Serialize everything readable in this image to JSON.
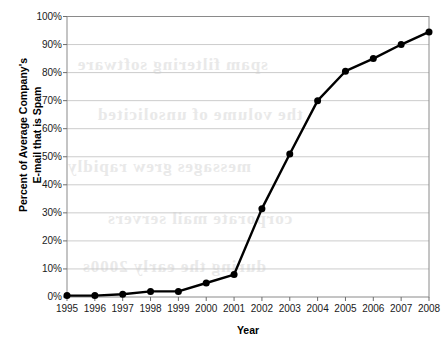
{
  "chart_data": {
    "type": "line",
    "title": "",
    "xlabel": "Year",
    "ylabel": "Percent of Average Company's E-mail that is Spam",
    "ylabel_line1": "Percent of Average Company's",
    "ylabel_line2": "E-mail that is Spam",
    "categories": [
      "1995",
      "1996",
      "1997",
      "1998",
      "1999",
      "2000",
      "2001",
      "2002",
      "2003",
      "2004",
      "2005",
      "2006",
      "2007",
      "2008"
    ],
    "values": [
      0.5,
      0.5,
      1,
      2,
      2,
      5,
      8,
      31.5,
      51,
      70,
      80.5,
      85,
      90,
      94.5
    ],
    "x": [
      1995,
      1996,
      1997,
      1998,
      1999,
      2000,
      2001,
      2002,
      2003,
      2004,
      2005,
      2006,
      2007,
      2008
    ],
    "series": [
      {
        "name": "Percent of Average Company's E-mail that is Spam",
        "values": [
          0.5,
          0.5,
          1,
          2,
          2,
          5,
          8,
          31.5,
          51,
          70,
          80.5,
          85,
          90,
          94.5
        ]
      }
    ],
    "ylim": [
      0,
      100
    ],
    "xlim": [
      1995,
      2008
    ],
    "y_ticks": [
      0,
      10,
      20,
      30,
      40,
      50,
      60,
      70,
      80,
      90,
      100
    ],
    "y_tick_labels": [
      "0%",
      "10%",
      "20%",
      "30%",
      "40%",
      "50%",
      "60%",
      "70%",
      "80%",
      "90%",
      "100%"
    ],
    "x_tick_labels": [
      "1995",
      "1996",
      "1997",
      "1998",
      "1999",
      "2000",
      "2001",
      "2002",
      "2003",
      "2004",
      "2005",
      "2006",
      "2007",
      "2008"
    ],
    "grid": true,
    "grid_axis": "y",
    "legend": false,
    "legend_position": "none",
    "marker": "circle",
    "line_color": "#000000",
    "marker_color": "#000000",
    "grid_color": "#cccccc",
    "background_color": "#ffffff",
    "annotations": []
  },
  "artifacts": {
    "description": "faint reversed text bleed-through from scanned page",
    "blots": [
      "spam filtering software",
      "the volume of unsolicited",
      "messages grew rapidly",
      "corporate mail servers",
      "during the early 2000s"
    ]
  }
}
